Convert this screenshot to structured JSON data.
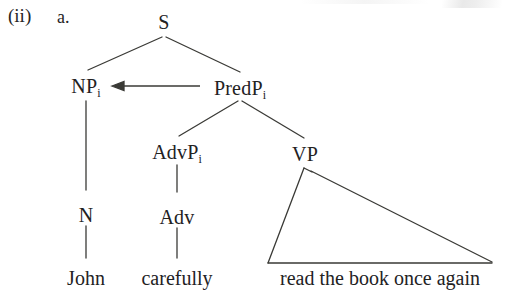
{
  "figure": {
    "enumeration": "(ii)",
    "item": "a.",
    "type": "syntax-tree"
  },
  "tree": {
    "nodes": [
      {
        "id": "s",
        "label": "S",
        "subscript": "",
        "x": 164,
        "y": 12
      },
      {
        "id": "np",
        "label": "NP",
        "subscript": "i",
        "x": 86,
        "y": 76
      },
      {
        "id": "predp",
        "label": "PredP",
        "subscript": "i",
        "x": 240,
        "y": 78
      },
      {
        "id": "advp",
        "label": "AdvP",
        "subscript": "i",
        "x": 177,
        "y": 142
      },
      {
        "id": "vp",
        "label": "VP",
        "subscript": "",
        "x": 305,
        "y": 144
      },
      {
        "id": "n",
        "label": "N",
        "subscript": "",
        "x": 86,
        "y": 205
      },
      {
        "id": "adv",
        "label": "Adv",
        "subscript": "",
        "x": 177,
        "y": 207
      }
    ],
    "leaves": [
      {
        "id": "john",
        "text": "John",
        "x": 86,
        "y": 268
      },
      {
        "id": "carefully",
        "text": "carefully",
        "x": 177,
        "y": 268
      },
      {
        "id": "vp-string",
        "text": "read the book once again",
        "x": 380,
        "y": 268
      }
    ],
    "movement_arrow": {
      "from": "PredP",
      "to": "NP",
      "direction": "left"
    },
    "triangle": {
      "node": "VP",
      "apex_x": 305,
      "apex_y": 167,
      "base_left_x": 268,
      "base_right_x": 492,
      "base_y": 263
    }
  }
}
